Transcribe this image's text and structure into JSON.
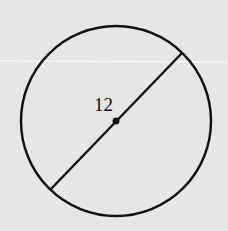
{
  "diagram": {
    "type": "circle-with-diameter",
    "label": "12",
    "colors": {
      "background": "#e6e6e4",
      "stroke": "#111111",
      "scan_line": "#f4f4f4"
    },
    "circle": {
      "cx": 116,
      "cy": 121,
      "r": 95
    },
    "diameter": {
      "x1": 182,
      "y1": 53,
      "x2": 50,
      "y2": 190
    },
    "center_dot": {
      "cx": 116,
      "cy": 121,
      "r": 3.5
    }
  }
}
